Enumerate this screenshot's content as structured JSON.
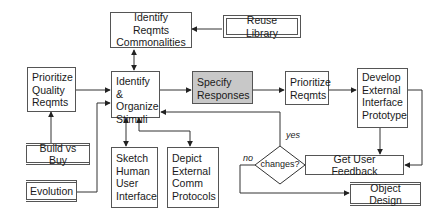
{
  "diagram": {
    "type": "flowchart",
    "nodes": {
      "identify_commonalities": "Identify Reqmts\nCommonalities",
      "reuse_library": "Reuse Library",
      "prioritize_quality": "Prioritize\nQuality\nReqmts",
      "identify_stimuli": "Identify &\nOrganize\nStimuli",
      "specify_responses": "Specify\nResponses",
      "prioritize_reqmts": "Prioritize\nReqmts",
      "develop_prototype": "Develop\nExternal\nInterface\nPrototype",
      "build_vs_buy": "Build vs Buy",
      "evolution": "Evolution",
      "sketch_ui": "Sketch\nHuman\nUser\nInterface",
      "depict_protocols": "Depict\nExternal\nComm\nProtocols",
      "changes_decision": "changes?",
      "get_feedback": "Get User Feedback",
      "object_design": "Object Design"
    },
    "edge_labels": {
      "yes": "yes",
      "no": "no"
    },
    "colors": {
      "highlight_fill": "#c8c8c8",
      "line": "#333333"
    }
  }
}
